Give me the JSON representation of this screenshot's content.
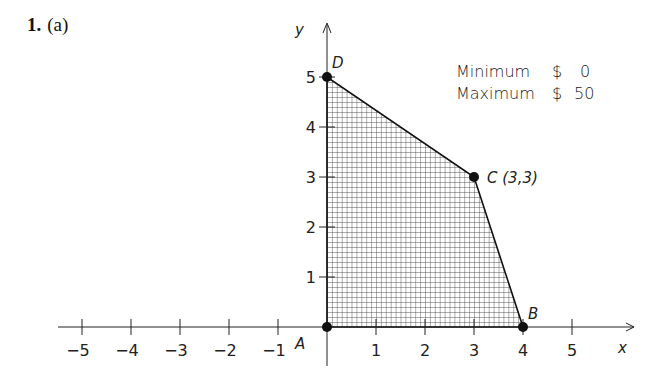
{
  "problem": {
    "number": "1.",
    "part": "(a)"
  },
  "axes": {
    "x_label": "x",
    "y_label": "y"
  },
  "legend": {
    "rows": [
      {
        "label": "Minimum",
        "currency": "$",
        "value": "0"
      },
      {
        "label": "Maximum",
        "currency": "$",
        "value": "50"
      }
    ]
  },
  "vertices": [
    {
      "name": "A",
      "x": 0,
      "y": 0,
      "label": "A"
    },
    {
      "name": "B",
      "x": 4,
      "y": 0,
      "label": "B"
    },
    {
      "name": "C",
      "x": 3,
      "y": 3,
      "label": "C (3,3)"
    },
    {
      "name": "D",
      "x": 0,
      "y": 5,
      "label": "D"
    }
  ],
  "chart_data": {
    "type": "scatter",
    "xlabel": "x",
    "ylabel": "y",
    "xlim": [
      -5.5,
      6
    ],
    "ylim": [
      0,
      6
    ],
    "x_ticks": [
      -5,
      -4,
      -3,
      -2,
      -1,
      1,
      2,
      3,
      4,
      5
    ],
    "y_ticks": [
      1,
      2,
      3,
      4,
      5
    ],
    "grid": false,
    "feasible_region": {
      "shape": "polygon",
      "fill": "crosshatch",
      "vertices": [
        [
          0,
          0
        ],
        [
          4,
          0
        ],
        [
          3,
          3
        ],
        [
          0,
          5
        ]
      ]
    },
    "points": [
      {
        "label": "A",
        "x": 0,
        "y": 0
      },
      {
        "label": "B",
        "x": 4,
        "y": 0
      },
      {
        "label": "C",
        "x": 3,
        "y": 3,
        "annotation": "(3,3)"
      },
      {
        "label": "D",
        "x": 0,
        "y": 5
      }
    ],
    "annotations": [
      "Minimum $ 0",
      "Maximum $ 50"
    ]
  }
}
